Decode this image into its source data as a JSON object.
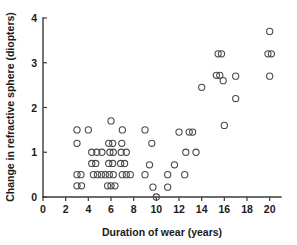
{
  "chart_data": {
    "type": "scatter",
    "title": "",
    "xlabel": "Duration of wear (years)",
    "ylabel": "Change in refractive sphere (diopters)",
    "xlim": [
      0,
      21
    ],
    "ylim": [
      0,
      4
    ],
    "xticks": [
      0,
      2,
      4,
      6,
      8,
      10,
      12,
      14,
      16,
      18,
      20
    ],
    "xticklabels": [
      "0",
      "2",
      "4",
      "6",
      "8",
      "10",
      "12",
      "14",
      "16",
      "18",
      "20"
    ],
    "yticks": [
      0,
      1,
      2,
      3,
      4
    ],
    "yticklabels": [
      "0",
      "1",
      "2",
      "3",
      "4"
    ],
    "grid": false,
    "legend": null,
    "marker": "open-circle",
    "points": [
      {
        "x": 3.0,
        "y": 1.5
      },
      {
        "x": 4.0,
        "y": 1.5
      },
      {
        "x": 3.0,
        "y": 1.2
      },
      {
        "x": 6.0,
        "y": 1.7
      },
      {
        "x": 5.8,
        "y": 1.2
      },
      {
        "x": 6.15,
        "y": 1.2
      },
      {
        "x": 6.95,
        "y": 1.2
      },
      {
        "x": 7.0,
        "y": 1.5
      },
      {
        "x": 9.0,
        "y": 1.5
      },
      {
        "x": 9.6,
        "y": 1.2
      },
      {
        "x": 4.3,
        "y": 1.0
      },
      {
        "x": 4.75,
        "y": 1.0
      },
      {
        "x": 5.2,
        "y": 1.0
      },
      {
        "x": 5.9,
        "y": 1.0
      },
      {
        "x": 6.2,
        "y": 1.0
      },
      {
        "x": 6.9,
        "y": 1.0
      },
      {
        "x": 7.35,
        "y": 1.0
      },
      {
        "x": 4.3,
        "y": 0.75
      },
      {
        "x": 4.65,
        "y": 0.75
      },
      {
        "x": 5.8,
        "y": 0.75
      },
      {
        "x": 6.15,
        "y": 0.75
      },
      {
        "x": 6.85,
        "y": 0.75
      },
      {
        "x": 7.2,
        "y": 0.75
      },
      {
        "x": 9.4,
        "y": 0.72
      },
      {
        "x": 3.0,
        "y": 0.5
      },
      {
        "x": 3.35,
        "y": 0.5
      },
      {
        "x": 4.45,
        "y": 0.5
      },
      {
        "x": 4.8,
        "y": 0.5
      },
      {
        "x": 5.15,
        "y": 0.5
      },
      {
        "x": 5.5,
        "y": 0.5
      },
      {
        "x": 5.85,
        "y": 0.5
      },
      {
        "x": 6.2,
        "y": 0.5
      },
      {
        "x": 7.0,
        "y": 0.5
      },
      {
        "x": 7.35,
        "y": 0.5
      },
      {
        "x": 7.7,
        "y": 0.5
      },
      {
        "x": 9.0,
        "y": 0.5
      },
      {
        "x": 3.0,
        "y": 0.25
      },
      {
        "x": 3.4,
        "y": 0.25
      },
      {
        "x": 5.7,
        "y": 0.25
      },
      {
        "x": 6.0,
        "y": 0.25
      },
      {
        "x": 6.35,
        "y": 0.25
      },
      {
        "x": 9.7,
        "y": 0.22
      },
      {
        "x": 11.0,
        "y": 0.22
      },
      {
        "x": 10.0,
        "y": 0.0
      },
      {
        "x": 11.0,
        "y": 0.5
      },
      {
        "x": 12.0,
        "y": 1.45
      },
      {
        "x": 12.9,
        "y": 1.45
      },
      {
        "x": 13.2,
        "y": 1.45
      },
      {
        "x": 12.6,
        "y": 1.0
      },
      {
        "x": 13.5,
        "y": 1.0
      },
      {
        "x": 12.5,
        "y": 0.5
      },
      {
        "x": 11.6,
        "y": 0.72
      },
      {
        "x": 14.0,
        "y": 2.45
      },
      {
        "x": 15.45,
        "y": 3.2
      },
      {
        "x": 15.75,
        "y": 3.2
      },
      {
        "x": 15.3,
        "y": 2.72
      },
      {
        "x": 15.6,
        "y": 2.72
      },
      {
        "x": 15.9,
        "y": 2.6
      },
      {
        "x": 17.0,
        "y": 2.7
      },
      {
        "x": 17.0,
        "y": 2.2
      },
      {
        "x": 16.0,
        "y": 1.6
      },
      {
        "x": 20.0,
        "y": 3.7
      },
      {
        "x": 19.85,
        "y": 3.2
      },
      {
        "x": 20.15,
        "y": 3.2
      },
      {
        "x": 20.0,
        "y": 2.7
      }
    ]
  }
}
